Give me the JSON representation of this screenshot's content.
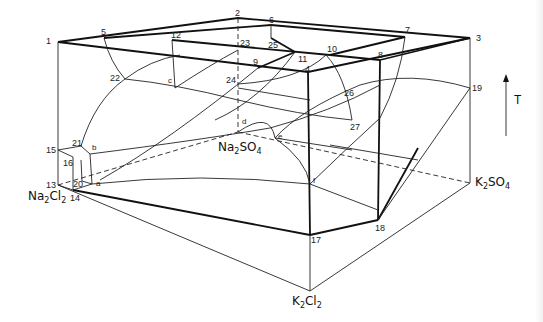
{
  "diagram": {
    "type": "ternary-reciprocal-salt-phase-prism",
    "components": {
      "na2cl2": {
        "label": "Na",
        "sub1": "2",
        "mid": "Cl",
        "sub2": "2"
      },
      "k2cl2": {
        "label": "K",
        "sub1": "2",
        "mid": "Cl",
        "sub2": "2"
      },
      "na2so4": {
        "label": "Na",
        "sub1": "2",
        "mid": "SO",
        "sub2": "4"
      },
      "k2so4": {
        "label": "K",
        "sub1": "2",
        "mid": "SO",
        "sub2": "4"
      }
    },
    "axis": {
      "label": "T",
      "direction": "up"
    },
    "points": {
      "p1": "1",
      "p2": "2",
      "p3": "3",
      "p4": "4",
      "p5": "5",
      "p6": "6",
      "p7": "7",
      "p8": "8",
      "p9": "9",
      "p10": "10",
      "p11": "11",
      "p12": "12",
      "p13": "13",
      "p14": "14",
      "p15": "15",
      "p16": "16",
      "p17": "17",
      "p18": "18",
      "p19": "19",
      "p20": "20",
      "p21": "21",
      "p22": "22",
      "p23": "23",
      "p24": "24",
      "p25": "25",
      "p26": "26",
      "p27": "27"
    },
    "letters": {
      "a": "a",
      "b": "b",
      "c": "c",
      "d": "d",
      "e": "e",
      "f": "f"
    },
    "colors": {
      "line": "#111111",
      "background": "#ffffff"
    }
  }
}
